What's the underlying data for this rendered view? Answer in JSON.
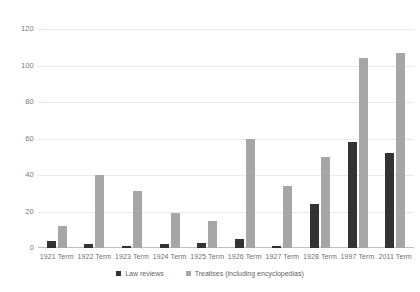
{
  "chart_data": {
    "type": "bar",
    "title": "",
    "subtitle": "",
    "xlabel": "",
    "ylabel": "",
    "ylim": [
      0,
      120
    ],
    "yticks": [
      0,
      20,
      40,
      60,
      80,
      100,
      120
    ],
    "grid": true,
    "legend_position": "bottom",
    "categories": [
      "1921 Term",
      "1922 Term",
      "1923 Term",
      "1924 Term",
      "1925 Term",
      "1926 Term",
      "1927 Term",
      "1928 Term",
      "1997 Term",
      "2011 Term"
    ],
    "series": [
      {
        "name": "Law reviews",
        "color": "#333333",
        "values": [
          4,
          2,
          1,
          2,
          3,
          5,
          1,
          24,
          58,
          52
        ]
      },
      {
        "name": "Treatises (including encyclopedias)",
        "color": "#a6a6a6",
        "values": [
          12,
          40,
          31,
          19,
          15,
          60,
          34,
          50,
          104,
          107
        ]
      }
    ]
  },
  "axis": {
    "y_tick_labels": [
      "120",
      "100",
      "80",
      "60",
      "40",
      "20",
      "0"
    ]
  },
  "legend": {
    "items": [
      {
        "label": "Law reviews",
        "swatch": "legend-swatch-law-reviews"
      },
      {
        "label": "Treatises (including encyclopedias)",
        "swatch": "legend-swatch-treatises"
      }
    ]
  }
}
